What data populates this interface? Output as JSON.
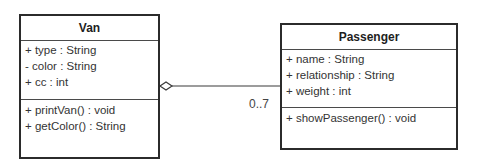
{
  "classes": {
    "van": {
      "name": "Van",
      "attributes": [
        "+ type : String",
        "- color : String",
        "+ cc : int"
      ],
      "operations": [
        "+ printVan() : void",
        "+ getColor() : String"
      ]
    },
    "passenger": {
      "name": "Passenger",
      "attributes": [
        "+ name : String",
        "+ relationship : String",
        "+ weight : int"
      ],
      "operations": [
        "+ showPassenger() : void"
      ]
    }
  },
  "association": {
    "type": "aggregation",
    "from": "Van",
    "to": "Passenger",
    "multiplicity_target": "0..7"
  }
}
